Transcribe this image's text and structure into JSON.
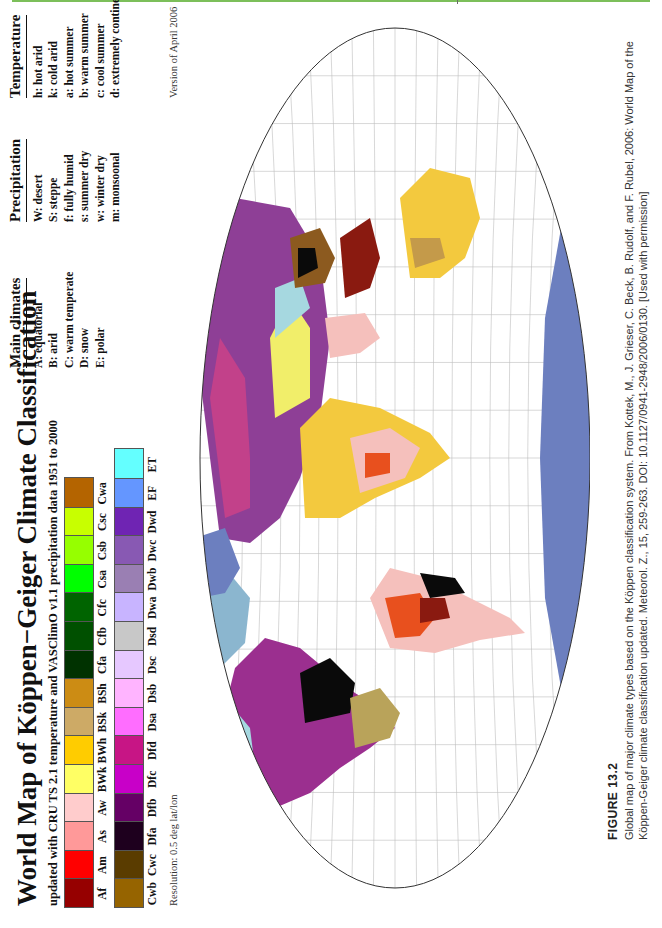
{
  "page": {
    "accent_line_color": "#7cbf5a"
  },
  "figure": {
    "title": "World Map of Köppen−Geiger Climate Classification",
    "subtitle": "updated with CRU TS 2.1 temperature and VASClimO v1.1 precipitation data 1951 to 2000",
    "resolution": "Resolution: 0.5 deg lat/lon",
    "version": "Version of April 2006",
    "legend_row1": [
      {
        "code": "Af",
        "color": "#960000"
      },
      {
        "code": "Am",
        "color": "#ff0000"
      },
      {
        "code": "As",
        "color": "#ff9999"
      },
      {
        "code": "Aw",
        "color": "#ffcccc"
      },
      {
        "code": "BWk",
        "color": "#ffff64"
      },
      {
        "code": "BWh",
        "color": "#ffcc00"
      },
      {
        "code": "BSk",
        "color": "#cdaa66"
      },
      {
        "code": "BSh",
        "color": "#cc8c14"
      },
      {
        "code": "Cfa",
        "color": "#003200"
      },
      {
        "code": "Cfb",
        "color": "#005000"
      },
      {
        "code": "Cfc",
        "color": "#006400"
      },
      {
        "code": "Csa",
        "color": "#00ff00"
      },
      {
        "code": "Csb",
        "color": "#96ff00"
      },
      {
        "code": "Csc",
        "color": "#c8ff00"
      },
      {
        "code": "Cwa",
        "color": "#b46400"
      }
    ],
    "legend_row2": [
      {
        "code": "Cwb",
        "color": "#966400"
      },
      {
        "code": "Cwc",
        "color": "#5a3c00"
      },
      {
        "code": "Dfa",
        "color": "#1e001e"
      },
      {
        "code": "Dfb",
        "color": "#650065"
      },
      {
        "code": "Dfc",
        "color": "#c800c8"
      },
      {
        "code": "Dfd",
        "color": "#c71585"
      },
      {
        "code": "Dsa",
        "color": "#ff6dff"
      },
      {
        "code": "Dsb",
        "color": "#ffb4ff"
      },
      {
        "code": "Dsc",
        "color": "#e6c8ff"
      },
      {
        "code": "Dsd",
        "color": "#c8c8c8"
      },
      {
        "code": "Dwa",
        "color": "#c8b4ff"
      },
      {
        "code": "Dwb",
        "color": "#9a7fb3"
      },
      {
        "code": "Dwc",
        "color": "#8859b3"
      },
      {
        "code": "Dwd",
        "color": "#6f24b3"
      },
      {
        "code": "EF",
        "color": "#6496ff"
      },
      {
        "code": "ET",
        "color": "#64ffff"
      }
    ],
    "main_climates": {
      "heading": "Main climates",
      "items": [
        "A: equatorial",
        "B: arid",
        "C: warm temperate",
        "D: snow",
        "E: polar"
      ]
    },
    "precipitation": {
      "heading": "Precipitation",
      "items": [
        "W: desert",
        "S: steppe",
        "f: fully humid",
        "s: summer dry",
        "w: winter dry",
        "m: monsoonal"
      ]
    },
    "temperature": {
      "heading": "Temperature",
      "items": [
        "h: hot arid",
        "k: cold arid",
        "a: hot summer",
        "b: warm summer",
        "c: cool summer",
        "d: extremely continental"
      ],
      "items2": [
        "F: polar frost",
        "T: polar tundra"
      ]
    },
    "longitude_ticks": [
      "−160",
      "−140",
      "−120",
      "−100",
      "−80",
      "−60",
      "−40",
      "−20",
      "0",
      "20",
      "40",
      "60",
      "80",
      "100",
      "120",
      "140",
      "160",
      "180"
    ],
    "latitude_ticks": [
      "90",
      "80",
      "70",
      "60",
      "50",
      "40",
      "30",
      "20",
      "10",
      "0",
      "−10",
      "−20",
      "−30",
      "−40",
      "−50",
      "−60",
      "−70",
      "−80",
      "−90"
    ],
    "map_region_labels": [
      "Dfd",
      "Dfc",
      "Dfb",
      "Dwa",
      "Dwb",
      "BWk",
      "ET",
      "Cfa",
      "Cwa",
      "Aw",
      "Am",
      "Af",
      "BWh",
      "BSh",
      "BSk",
      "Cfb",
      "Csa",
      "Csb",
      "Cwb",
      "EF",
      "Dsc"
    ]
  },
  "caption": {
    "figure_label": "FIGURE 13.2",
    "text": "Global map of major climate types based on the Köppen classification system. From Kottek, M., J. Grieser, C. Beck, B. Rudolf, and F. Rubel, 2006: World Map of the Köppen-Geiger climate classification updated. Meteorol. Z., 15, 259-263. DOI: 10.1127/0941-2948/2006/0130. [Used with permission]"
  }
}
